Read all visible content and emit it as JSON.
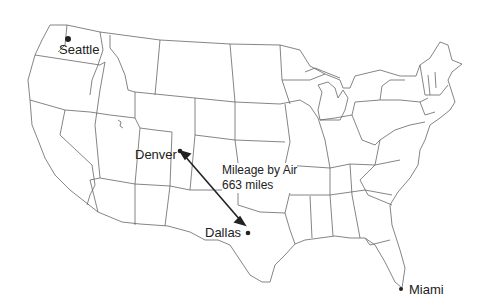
{
  "map": {
    "title": "United States",
    "cities": [
      {
        "name": "Seattle",
        "x": 64,
        "y": 36
      },
      {
        "name": "Denver",
        "x": 180,
        "y": 151
      },
      {
        "name": "Dallas",
        "x": 247,
        "y": 233
      },
      {
        "name": "Miami",
        "x": 400,
        "y": 289
      }
    ],
    "route": {
      "from": "Denver",
      "to": "Dallas",
      "label_line1": "Mileage by Air",
      "label_line2": "663 miles"
    },
    "colors": {
      "border": "#555555",
      "text": "#222222",
      "background": "#ffffff"
    }
  }
}
